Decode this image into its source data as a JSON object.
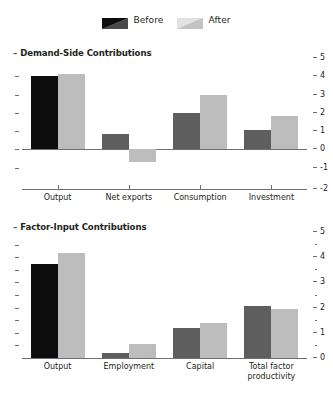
{
  "legend": {
    "entries": [
      {
        "label": "Before",
        "color": "#1a1a1a",
        "icon": "swatch-diagonal-dark"
      },
      {
        "label": "After",
        "color": "#c9c9c9",
        "icon": "swatch-diagonal-light"
      }
    ]
  },
  "chart_data": [
    {
      "type": "bar",
      "title": "Demand-Side Contributions",
      "categories": [
        "Output",
        "Net exports",
        "Consumption",
        "Investment"
      ],
      "series": [
        {
          "name": "Before",
          "values": [
            4.0,
            0.85,
            2.0,
            1.05
          ]
        },
        {
          "name": "After",
          "values": [
            4.15,
            -0.7,
            3.0,
            1.85
          ]
        }
      ],
      "ylim": [
        -2,
        5
      ],
      "yticks": [
        -1,
        0,
        1,
        2,
        3,
        4,
        5
      ],
      "ytick_labels": [
        "-1",
        "0",
        "1",
        "2",
        "3",
        "4",
        "5"
      ],
      "xlabel": "",
      "ylabel": "",
      "grid": false,
      "legend_position": "top-center",
      "axis_position": "right"
    },
    {
      "type": "bar",
      "title": "Factor-Input Contributions",
      "categories": [
        "Output",
        "Employment",
        "Capital",
        "Total factor productivity"
      ],
      "series": [
        {
          "name": "Before",
          "values": [
            3.75,
            0.2,
            1.2,
            2.05
          ]
        },
        {
          "name": "After",
          "values": [
            4.15,
            0.55,
            1.4,
            1.95
          ]
        }
      ],
      "ylim": [
        0,
        5
      ],
      "yticks": [
        0,
        1,
        2,
        3,
        4,
        5
      ],
      "ytick_labels": [
        "0",
        "1",
        "2",
        "3",
        "4",
        "5"
      ],
      "yminor_ticks": [
        0.5,
        1.5,
        2.5,
        3.5,
        4.5
      ],
      "xlabel": "",
      "ylabel": "",
      "grid": false,
      "legend_position": "top-center",
      "axis_position": "right"
    }
  ],
  "colors": {
    "before_dark": "#5e5e5e",
    "before_black": "#0d0d0d",
    "after_light": "#bdbdbd",
    "axis": "#6f6f6f",
    "text": "#231f20"
  }
}
